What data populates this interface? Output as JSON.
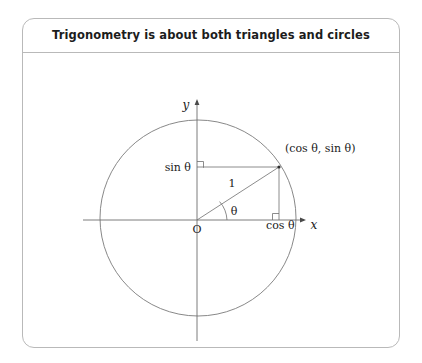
{
  "card": {
    "title": "Trigonometry is about both triangles and circles"
  },
  "figure": {
    "name": "unit-circle-diagram",
    "axes": {
      "x_label": "x",
      "y_label": "y",
      "origin_label": "O"
    },
    "labels": {
      "sin": "sin θ",
      "cos": "cos θ",
      "radius": "1",
      "angle": "θ",
      "point": "(cos θ, sin θ)"
    },
    "colors": {
      "stroke": "#6e6e6e",
      "text": "#1a1a1a",
      "border": "#b9b9b9"
    }
  }
}
